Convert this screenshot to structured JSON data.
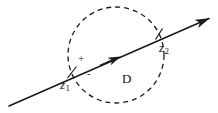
{
  "figure": {
    "background_color": "#ffffff",
    "stroke_color": "#1a1a1a",
    "width": 218,
    "height": 113
  },
  "labels": {
    "z1": {
      "base": "z",
      "sub": "1"
    },
    "z2": {
      "base": "z",
      "sub": "2"
    },
    "region": "D",
    "plus_sign": "+",
    "minus_sign": "-"
  },
  "geometry": {
    "circle": {
      "name": "region-D-boundary",
      "center_x": 116,
      "center_y": 55,
      "radius": 48,
      "style": "dashed",
      "dash_pattern": "5 4",
      "stroke_width": 1.3
    },
    "line": {
      "name": "directed-line",
      "x1": 9,
      "y1": 106,
      "x2": 212,
      "y2": 16,
      "stroke_width": 1.6,
      "arrow_end": true,
      "mid_arrow_at_x": 112,
      "mid_arrow_at_y": 60
    },
    "intersections": [
      {
        "name": "z1",
        "x": 72,
        "y": 72
      },
      {
        "name": "z2",
        "x": 159,
        "y": 34
      }
    ]
  }
}
